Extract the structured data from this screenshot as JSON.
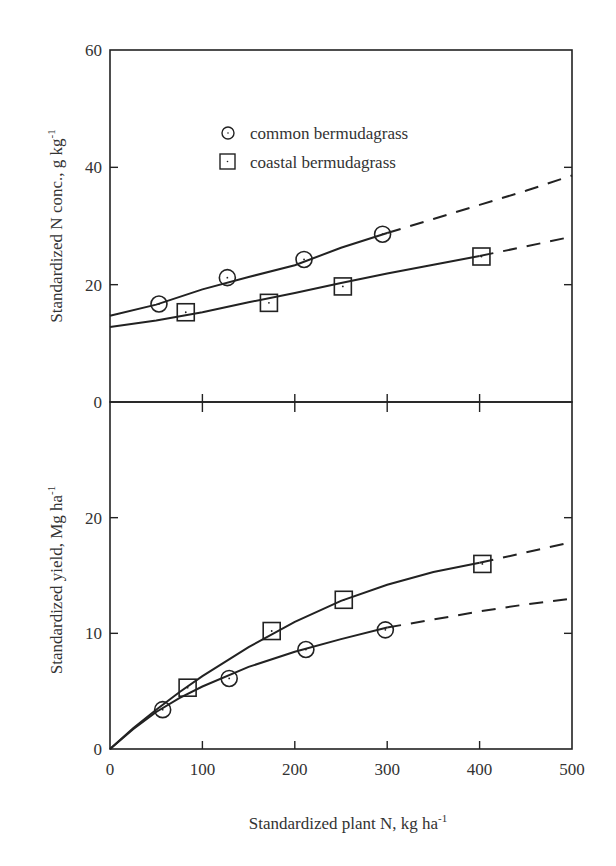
{
  "chart_data": [
    {
      "type": "scatter",
      "panel": "top",
      "title": "",
      "xlabel": "",
      "ylabel": "Standardized N conc., g kg",
      "ylabel_superscript": "-1",
      "xlim": [
        0,
        500
      ],
      "ylim": [
        0,
        60
      ],
      "y_ticks": [
        "0",
        "20",
        "40",
        "60"
      ],
      "y_tick_values": [
        0,
        20,
        40,
        60
      ],
      "x_tick_values": [
        0,
        100,
        200,
        300,
        400,
        500
      ],
      "legend": {
        "position": "upper-left-inside",
        "entries": [
          {
            "label": "common bermudagrass",
            "marker": "circle"
          },
          {
            "label": "coastal bermudagrass",
            "marker": "square"
          }
        ]
      },
      "series": [
        {
          "name": "common bermudagrass",
          "marker": "circle",
          "x": [
            53,
            127,
            210,
            295
          ],
          "y": [
            16.7,
            21.2,
            24.3,
            28.6
          ],
          "fit_solid": [
            [
              0,
              14.7
            ],
            [
              50,
              16.6
            ],
            [
              100,
              19.2
            ],
            [
              150,
              21.3
            ],
            [
              200,
              23.3
            ],
            [
              250,
              26.3
            ],
            [
              300,
              28.8
            ]
          ],
          "fit_dashed": [
            [
              300,
              28.8
            ],
            [
              350,
              31.2
            ],
            [
              400,
              33.6
            ],
            [
              450,
              36.0
            ],
            [
              500,
              38.6
            ]
          ]
        },
        {
          "name": "coastal bermudagrass",
          "marker": "square",
          "x": [
            82,
            172,
            252,
            402
          ],
          "y": [
            15.3,
            16.9,
            19.7,
            24.8
          ],
          "fit_solid": [
            [
              0,
              12.8
            ],
            [
              50,
              13.9
            ],
            [
              100,
              15.3
            ],
            [
              150,
              17.0
            ],
            [
              200,
              18.6
            ],
            [
              250,
              20.3
            ],
            [
              300,
              21.9
            ],
            [
              350,
              23.4
            ],
            [
              400,
              24.9
            ]
          ],
          "fit_dashed": [
            [
              400,
              24.9
            ],
            [
              450,
              26.5
            ],
            [
              500,
              28.2
            ]
          ]
        }
      ]
    },
    {
      "type": "scatter",
      "panel": "bottom",
      "title": "",
      "xlabel": "Standardized plant N, kg ha",
      "xlabel_superscript": "-1",
      "ylabel": "Standardized yield, Mg ha",
      "ylabel_superscript": "-1",
      "xlim": [
        0,
        500
      ],
      "ylim": [
        0,
        30
      ],
      "x_ticks": [
        "0",
        "100",
        "200",
        "300",
        "400",
        "500"
      ],
      "x_tick_values": [
        0,
        100,
        200,
        300,
        400,
        500
      ],
      "y_ticks": [
        "0",
        "10",
        "20"
      ],
      "y_tick_values": [
        0,
        10,
        20
      ],
      "series": [
        {
          "name": "common bermudagrass",
          "marker": "circle",
          "x": [
            57,
            129,
            212,
            298
          ],
          "y": [
            3.4,
            6.1,
            8.6,
            10.3
          ],
          "fit_solid": [
            [
              0,
              0
            ],
            [
              25,
              1.7
            ],
            [
              50,
              3.2
            ],
            [
              75,
              4.4
            ],
            [
              100,
              5.4
            ],
            [
              150,
              7.1
            ],
            [
              200,
              8.4
            ],
            [
              250,
              9.5
            ],
            [
              300,
              10.5
            ]
          ],
          "fit_dashed": [
            [
              300,
              10.5
            ],
            [
              350,
              11.2
            ],
            [
              400,
              11.9
            ],
            [
              450,
              12.5
            ],
            [
              500,
              13.0
            ]
          ]
        },
        {
          "name": "coastal bermudagrass",
          "marker": "square",
          "x": [
            84,
            175,
            253,
            403
          ],
          "y": [
            5.3,
            10.2,
            12.9,
            16.0
          ],
          "fit_solid": [
            [
              0,
              0
            ],
            [
              25,
              1.8
            ],
            [
              50,
              3.4
            ],
            [
              75,
              4.9
            ],
            [
              100,
              6.3
            ],
            [
              150,
              8.8
            ],
            [
              200,
              11.0
            ],
            [
              250,
              12.8
            ],
            [
              300,
              14.2
            ],
            [
              350,
              15.3
            ],
            [
              400,
              16.1
            ]
          ],
          "fit_dashed": [
            [
              400,
              16.1
            ],
            [
              450,
              17.0
            ],
            [
              500,
              17.9
            ]
          ]
        }
      ]
    }
  ],
  "labels": {
    "top_ylabel": "Standardized N conc., g kg",
    "top_ylabel_sup": "-1",
    "bottom_ylabel": "Standardized yield, Mg ha",
    "bottom_ylabel_sup": "-1",
    "xlabel": "Standardized plant N, kg ha",
    "xlabel_sup": "-1",
    "legend_common": "common bermudagrass",
    "legend_coastal": "coastal bermudagrass",
    "top_ticks": [
      "0",
      "20",
      "40",
      "60"
    ],
    "bottom_yticks": [
      "0",
      "10",
      "20"
    ],
    "xticks": [
      "0",
      "100",
      "200",
      "300",
      "400",
      "500"
    ]
  }
}
